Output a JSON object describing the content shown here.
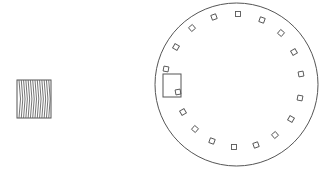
{
  "colors": {
    "background": "#ffffff",
    "stroke": "#555555",
    "stripe": "#666666"
  },
  "striped_block": {
    "x": 17,
    "y": 80,
    "width": 34,
    "height": 38,
    "stripe_count": 14
  },
  "circle": {
    "cx": 236.5,
    "cy": 84.5,
    "r": 81.5
  },
  "highlight_box": {
    "x": 163,
    "y": 74,
    "width": 18,
    "height": 23
  },
  "markers": [
    {
      "x": 238,
      "y": 14
    },
    {
      "x": 262,
      "y": 20
    },
    {
      "x": 281,
      "y": 33
    },
    {
      "x": 294,
      "y": 52
    },
    {
      "x": 301,
      "y": 74
    },
    {
      "x": 300,
      "y": 98
    },
    {
      "x": 291,
      "y": 119
    },
    {
      "x": 275,
      "y": 135
    },
    {
      "x": 256,
      "y": 145
    },
    {
      "x": 234,
      "y": 147
    },
    {
      "x": 212,
      "y": 141
    },
    {
      "x": 195,
      "y": 129
    },
    {
      "x": 183,
      "y": 112
    },
    {
      "x": 178,
      "y": 92
    },
    {
      "x": 166,
      "y": 69
    },
    {
      "x": 176,
      "y": 47
    },
    {
      "x": 192,
      "y": 28
    },
    {
      "x": 214,
      "y": 17
    }
  ],
  "marker_size": 5
}
